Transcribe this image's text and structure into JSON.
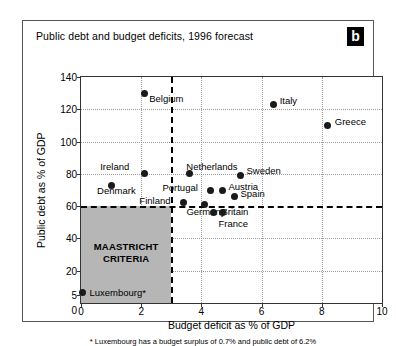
{
  "figure": {
    "title": "Public debt and budget deficits, 1996 forecast",
    "panel_badge": "b",
    "footnote": "* Luxembourg has a budget surplus of 0.7% and public debt of 6.2%"
  },
  "chart_data": {
    "type": "scatter",
    "title": "Public debt and budget deficits, 1996 forecast",
    "xlabel": "Budget deficit as % of GDP",
    "ylabel": "Public debt as % of GDP",
    "xlim": [
      0,
      10
    ],
    "ylim": [
      0,
      140
    ],
    "xticks": [
      "0",
      "2",
      "4",
      "6",
      "8",
      "10"
    ],
    "xtick_values": [
      0,
      2,
      4,
      6,
      8,
      10
    ],
    "yticks": [
      "0",
      "5",
      "20",
      "40",
      "60",
      "80",
      "100",
      "120",
      "140"
    ],
    "ytick_values": [
      0,
      5,
      20,
      40,
      60,
      80,
      100,
      120,
      140
    ],
    "grid": true,
    "legend": null,
    "annotations": [
      {
        "name": "maastricht-criteria",
        "text": "MAASTRICHT\nCRITERIA",
        "line1": "MAASTRICHT",
        "line2": "CRITERIA",
        "x_range": [
          0,
          3
        ],
        "y_range": [
          0,
          60
        ],
        "fill": "#b6b6b6"
      },
      {
        "name": "debt-threshold",
        "text": "60% public debt limit",
        "y": 60,
        "style": "dashed"
      },
      {
        "name": "deficit-threshold",
        "text": "3% budget deficit limit",
        "x": 3,
        "style": "dashed"
      }
    ],
    "points": [
      {
        "label": "Belgium",
        "x": 2.1,
        "y": 130,
        "label_dx": 5,
        "label_dy": 6
      },
      {
        "label": "Italy",
        "x": 6.4,
        "y": 123,
        "label_dx": 6,
        "label_dy": -3
      },
      {
        "label": "Greece",
        "x": 8.2,
        "y": 110,
        "label_dx": 7,
        "label_dy": -3
      },
      {
        "label": "Ireland",
        "x": 2.1,
        "y": 80,
        "label_dx": -44,
        "label_dy": -7
      },
      {
        "label": "Netherlands",
        "x": 3.6,
        "y": 80,
        "label_dx": -3,
        "label_dy": -7
      },
      {
        "label": "Sweden",
        "x": 5.3,
        "y": 79,
        "label_dx": 6,
        "label_dy": -4
      },
      {
        "label": "Denmark",
        "x": 1.0,
        "y": 73,
        "label_dx": -14,
        "label_dy": 6
      },
      {
        "label": "Portugal",
        "x": 4.3,
        "y": 70,
        "label_dx": -48,
        "label_dy": -2
      },
      {
        "label": "Austria",
        "x": 4.7,
        "y": 70,
        "label_dx": 6,
        "label_dy": -3
      },
      {
        "label": "Spain",
        "x": 5.1,
        "y": 66,
        "label_dx": 6,
        "label_dy": -2
      },
      {
        "label": "Finland",
        "x": 3.4,
        "y": 62,
        "label_dx": -44,
        "label_dy": -2
      },
      {
        "label": "Germany",
        "x": 4.1,
        "y": 61,
        "label_dx": -18,
        "label_dy": 7
      },
      {
        "label": "Britain",
        "x": 4.4,
        "y": 56,
        "label_dx": 8,
        "label_dy": -1
      },
      {
        "label": "France",
        "x": 4.7,
        "y": 56,
        "label_dx": -4,
        "label_dy": 11
      },
      {
        "label": "Luxembourg*",
        "x": 0.05,
        "y": 6.2,
        "label_dx": 7,
        "label_dy": 0
      }
    ]
  }
}
